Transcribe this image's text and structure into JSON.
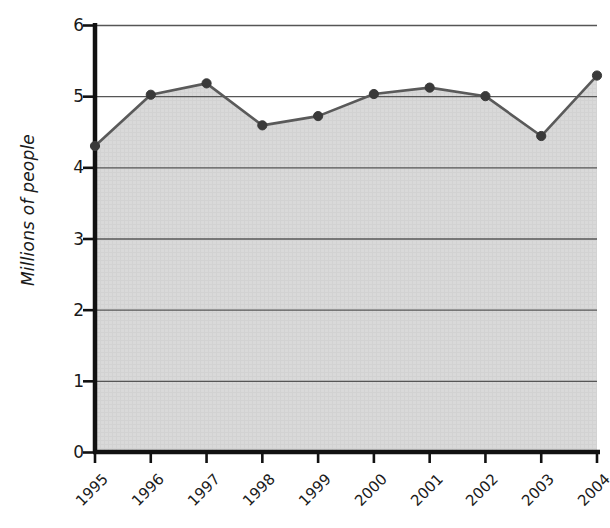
{
  "chart_data": {
    "type": "area",
    "title": "",
    "subtitle": "",
    "xlabel": "",
    "ylabel": "Millions of people",
    "categories": [
      "1995",
      "1996",
      "1997",
      "1998",
      "1999",
      "2000",
      "2001",
      "2002",
      "2003",
      "2004"
    ],
    "values": [
      4.3,
      5.02,
      5.18,
      4.59,
      4.72,
      5.03,
      5.12,
      5.0,
      4.44,
      5.29
    ],
    "ylim": [
      0,
      6
    ],
    "ytick_labels": [
      "0",
      "1",
      "2",
      "3",
      "4",
      "5",
      "6"
    ],
    "ytick_values": [
      0,
      1,
      2,
      3,
      4,
      5,
      6
    ],
    "grid": true,
    "grid_axis": "y",
    "legend": false,
    "legend_position": "none",
    "markers": true,
    "xtick_rotation": -45,
    "colors": {
      "area_fill": "#d8d8d8",
      "line": "#5a5a5a",
      "marker": "#3a3a3a",
      "gridline": "#55555 5",
      "axis": "#111111",
      "text": "#1a1a1a",
      "background": "#ffffff"
    }
  }
}
